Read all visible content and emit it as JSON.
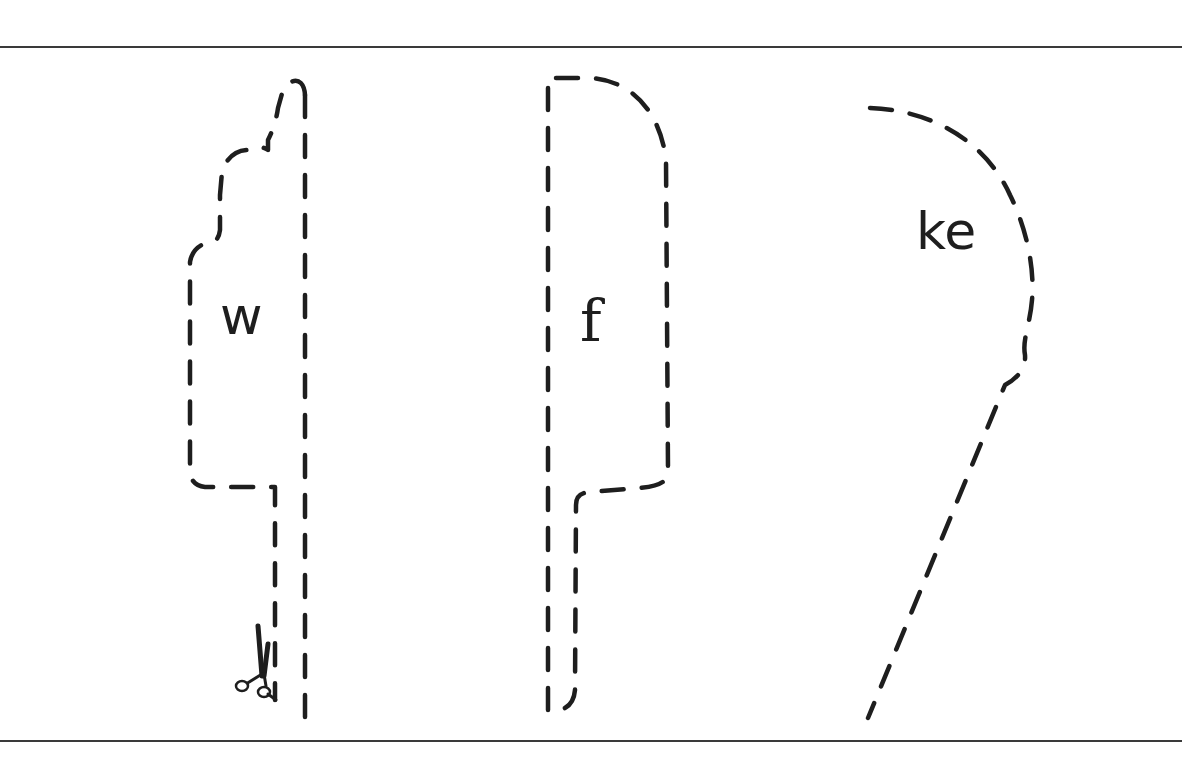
{
  "worksheet": {
    "shapes": [
      {
        "id": "shape-1",
        "label": "w",
        "has_scissors": true
      },
      {
        "id": "shape-2",
        "label": "f",
        "has_scissors": false
      },
      {
        "id": "shape-3",
        "label": "ke",
        "has_scissors": false
      }
    ],
    "colors": {
      "ink": "#1e1e1e",
      "rule": "#3a3a3a",
      "paper": "#ffffff"
    },
    "icons": {
      "scissors": "scissors-icon"
    }
  }
}
